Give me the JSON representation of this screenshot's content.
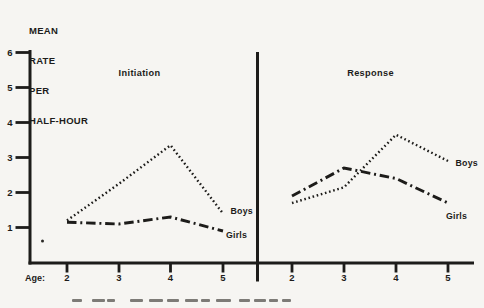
{
  "figure": {
    "background": "#f6f5f2",
    "ink_color": "#1d1c1a"
  },
  "labels": {
    "y_axis_title_lines": [
      "MEAN",
      "RATE",
      "PER",
      "HALF-HOUR"
    ],
    "x_axis_label": "Age:"
  },
  "chart_data": {
    "type": "line",
    "title": "",
    "ylabel": "MEAN RATE PER HALF-HOUR",
    "xlabel": "Age:",
    "x": [
      2,
      3,
      4,
      5
    ],
    "y_ticks": [
      1,
      2,
      3,
      4,
      5,
      6
    ],
    "ylim": [
      0,
      6
    ],
    "grid": false,
    "legend_position": "line-end-labels",
    "panels": [
      {
        "title": "Initiation",
        "series": [
          {
            "name": "Boys",
            "style": "dotted",
            "values": [
              1.2,
              2.25,
              3.35,
              1.4
            ]
          },
          {
            "name": "Girls",
            "style": "dash-dot",
            "values": [
              1.15,
              1.1,
              1.3,
              0.9
            ]
          }
        ]
      },
      {
        "title": "Response",
        "series": [
          {
            "name": "Boys",
            "style": "dotted",
            "values": [
              1.7,
              2.15,
              3.65,
              2.9
            ]
          },
          {
            "name": "Girls",
            "style": "dash-dot",
            "values": [
              1.9,
              2.7,
              2.4,
              1.7
            ]
          }
        ]
      }
    ]
  },
  "artifacts": {
    "stray_dot": {
      "x": 42.5,
      "y": 241
    },
    "caption_marks": [
      {
        "x": 72,
        "w": 10
      },
      {
        "x": 92,
        "w": 13
      },
      {
        "x": 107,
        "w": 8
      },
      {
        "x": 130,
        "w": 13
      },
      {
        "x": 149,
        "w": 14
      },
      {
        "x": 167,
        "w": 12
      },
      {
        "x": 185,
        "w": 13
      },
      {
        "x": 201,
        "w": 9
      },
      {
        "x": 216,
        "w": 15
      },
      {
        "x": 239,
        "w": 11
      },
      {
        "x": 254,
        "w": 12
      },
      {
        "x": 269,
        "w": 9
      },
      {
        "x": 282,
        "w": 9
      }
    ]
  }
}
